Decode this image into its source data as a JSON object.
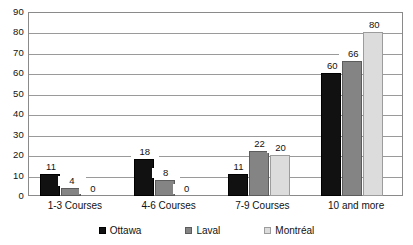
{
  "chart_data": {
    "type": "bar",
    "title": "",
    "subtitle": "",
    "xlabel": "",
    "ylabel": "",
    "ylim": [
      0,
      90
    ],
    "ytick_step": 10,
    "yticks": [
      90,
      80,
      70,
      60,
      50,
      40,
      30,
      20,
      10,
      0
    ],
    "grid": true,
    "legend_position": "bottom-center",
    "categories": [
      "1-3 Courses",
      "4-6 Courses",
      "7-9 Courses",
      "10 and more"
    ],
    "series": [
      {
        "name": "Ottawa",
        "color": "#111111",
        "values": [
          11,
          18,
          11,
          60
        ]
      },
      {
        "name": "Laval",
        "color": "#848484",
        "values": [
          4,
          8,
          22,
          66
        ]
      },
      {
        "name": "Montréal",
        "color": "#dcdcdc",
        "values": [
          0,
          0,
          20,
          80
        ]
      }
    ],
    "data_labels": [
      [
        "11",
        "4",
        "0"
      ],
      [
        "18",
        "8",
        "0"
      ],
      [
        "11",
        "22",
        "20"
      ],
      [
        "60",
        "66",
        "80"
      ]
    ]
  },
  "legend": {
    "items": [
      {
        "label": "Ottawa"
      },
      {
        "label": "Laval"
      },
      {
        "label": "Montréal"
      }
    ]
  }
}
